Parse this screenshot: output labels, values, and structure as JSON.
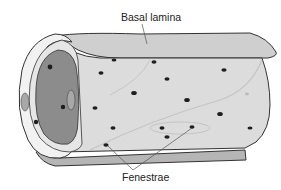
{
  "diagram": {
    "labels": {
      "basal_lamina": "Basal lamina",
      "fenestrae": "Fenestrae"
    },
    "colors": {
      "tube_fill": "#d9d9d9",
      "basal_lamina_fill": "#cfcfcf",
      "lumen_fill": "#8c8c8c",
      "outline": "#333333",
      "pore": "#1e1e1e",
      "leader_line": "#555555"
    },
    "fenestrae_count_visible": 16
  }
}
